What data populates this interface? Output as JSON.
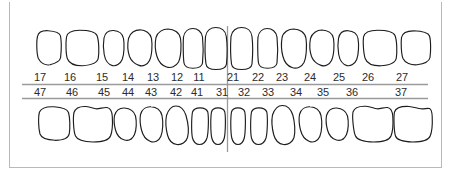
{
  "diagram": {
    "notation": "FDI",
    "colors": {
      "tooth_outline": "#1d1d1d",
      "tooth_fill": "#ffffff",
      "reference_line": "#9a9a9a",
      "frame": "#b9b9b9",
      "label_text": "#2b2b2b"
    },
    "quadrants": {
      "upper_right": {
        "name": "upper-right-quadrant",
        "teeth": [
          {
            "number": "17",
            "type": "molar",
            "label_x": 40,
            "shape_x": 34,
            "shape_w": 27
          },
          {
            "number": "16",
            "type": "molar",
            "label_x": 70,
            "shape_x": 65,
            "shape_w": 34
          },
          {
            "number": "15",
            "type": "premolar",
            "label_x": 102,
            "shape_x": 102,
            "shape_w": 22
          },
          {
            "number": "14",
            "type": "premolar",
            "label_x": 128,
            "shape_x": 127,
            "shape_w": 25
          },
          {
            "number": "13",
            "type": "canine",
            "label_x": 153,
            "shape_x": 155,
            "shape_w": 26
          },
          {
            "number": "12",
            "type": "incisor",
            "label_x": 177,
            "shape_x": 182,
            "shape_w": 21
          },
          {
            "number": "11",
            "type": "incisor",
            "label_x": 199,
            "shape_x": 204,
            "shape_w": 23
          }
        ]
      },
      "upper_left": {
        "name": "upper-left-quadrant",
        "teeth": [
          {
            "number": "21",
            "type": "incisor",
            "label_x": 233,
            "shape_x": 231,
            "shape_w": 24
          },
          {
            "number": "22",
            "type": "incisor",
            "label_x": 258,
            "shape_x": 258,
            "shape_w": 21
          },
          {
            "number": "23",
            "type": "canine",
            "label_x": 282,
            "shape_x": 281,
            "shape_w": 26
          },
          {
            "number": "24",
            "type": "premolar",
            "label_x": 310,
            "shape_x": 310,
            "shape_w": 25
          },
          {
            "number": "25",
            "type": "premolar",
            "label_x": 339,
            "shape_x": 338,
            "shape_w": 22
          },
          {
            "number": "26",
            "type": "molar",
            "label_x": 368,
            "shape_x": 363,
            "shape_w": 34
          },
          {
            "number": "27",
            "type": "molar",
            "label_x": 402,
            "shape_x": 401,
            "shape_w": 29
          }
        ]
      },
      "lower_right": {
        "name": "lower-right-quadrant",
        "teeth": [
          {
            "number": "47",
            "type": "molar",
            "label_x": 40,
            "shape_x": 36,
            "shape_w": 33
          },
          {
            "number": "46",
            "type": "molar",
            "label_x": 72,
            "shape_x": 73,
            "shape_w": 39
          },
          {
            "number": "45",
            "type": "premolar",
            "label_x": 104,
            "shape_x": 114,
            "shape_w": 22
          },
          {
            "number": "44",
            "type": "premolar",
            "label_x": 128,
            "shape_x": 140,
            "shape_w": 23
          },
          {
            "number": "43",
            "type": "canine",
            "label_x": 151,
            "shape_x": 166,
            "shape_w": 23
          },
          {
            "number": "42",
            "type": "incisor",
            "label_x": 176,
            "shape_x": 191,
            "shape_w": 17
          },
          {
            "number": "41",
            "type": "incisor",
            "label_x": 197,
            "shape_x": 211,
            "shape_w": 15
          }
        ]
      },
      "lower_left": {
        "name": "lower-left-quadrant",
        "teeth": [
          {
            "number": "31",
            "type": "incisor",
            "label_x": 222,
            "shape_x": 231,
            "shape_w": 16
          },
          {
            "number": "32",
            "type": "incisor",
            "label_x": 244,
            "shape_x": 251,
            "shape_w": 17
          },
          {
            "number": "33",
            "type": "canine",
            "label_x": 268,
            "shape_x": 272,
            "shape_w": 24
          },
          {
            "number": "34",
            "type": "premolar",
            "label_x": 296,
            "shape_x": 299,
            "shape_w": 24
          },
          {
            "number": "35",
            "type": "premolar",
            "label_x": 323,
            "shape_x": 326,
            "shape_w": 23
          },
          {
            "number": "36",
            "type": "molar",
            "label_x": 352,
            "shape_x": 352,
            "shape_w": 38
          },
          {
            "number": "37",
            "type": "molar",
            "label_x": 401,
            "shape_x": 394,
            "shape_w": 38
          }
        ]
      }
    },
    "reference_lines": {
      "upper_line_label": "maxillary-occlusal-line",
      "lower_line_label": "mandibular-occlusal-line",
      "midline_label": "arch-midline"
    }
  }
}
